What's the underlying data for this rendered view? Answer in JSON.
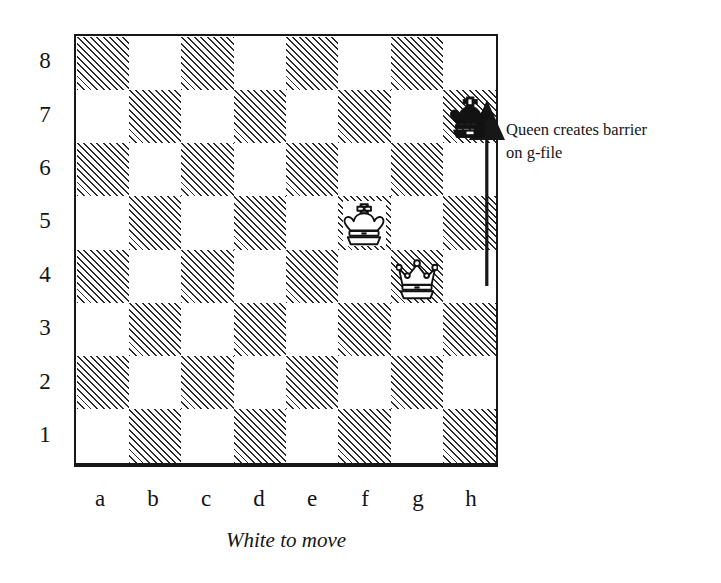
{
  "diagram": {
    "type": "chess-position",
    "caption": "White to move",
    "side_to_move": "White",
    "files": [
      "a",
      "b",
      "c",
      "d",
      "e",
      "f",
      "g",
      "h"
    ],
    "ranks": [
      "8",
      "7",
      "6",
      "5",
      "4",
      "3",
      "2",
      "1"
    ],
    "board": {
      "orientation": "white-bottom",
      "light_square_color": "#ffffff",
      "dark_square_color": "#2b2b2b",
      "dark_square_fill": "diagonal-hatch",
      "border_color": "#171717"
    },
    "pieces": [
      {
        "piece": "king",
        "color": "black",
        "square": "h7",
        "file": 7,
        "rank": 7,
        "glyph": "black-king-icon",
        "on_dark_square": false
      },
      {
        "piece": "king",
        "color": "white",
        "square": "f6",
        "file": 5,
        "rank": 6,
        "glyph": "white-king-icon",
        "on_dark_square": true
      },
      {
        "piece": "queen",
        "color": "white",
        "square": "g4",
        "file": 6,
        "rank": 4,
        "glyph": "white-queen-icon",
        "on_dark_square": false
      }
    ],
    "arrow": {
      "name": "move-arrow",
      "from_square": "g5",
      "to_square": "g8",
      "file": "g",
      "direction": "up",
      "color": "#171717"
    },
    "annotation": {
      "line1": "Queen creates barrier",
      "line2": "on g-file"
    }
  }
}
